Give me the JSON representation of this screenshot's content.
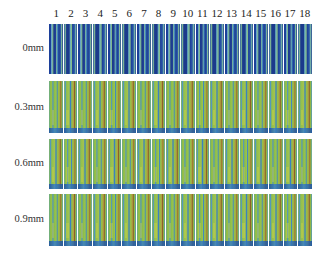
{
  "figure": {
    "column_labels": [
      "1",
      "2",
      "3",
      "4",
      "5",
      "6",
      "7",
      "8",
      "9",
      "10",
      "11",
      "12",
      "13",
      "14",
      "15",
      "16",
      "17",
      "18"
    ],
    "rows": [
      {
        "label": "0mm",
        "style": "blue-striped"
      },
      {
        "label": "0.3mm",
        "style": "green"
      },
      {
        "label": "0.6mm",
        "style": "green"
      },
      {
        "label": "0.9mm",
        "style": "green"
      }
    ]
  }
}
